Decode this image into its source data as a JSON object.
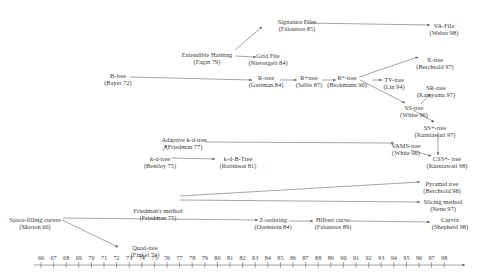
{
  "diagram": {
    "nodes": [
      {
        "id": "sigfiles",
        "label": "Signature Files",
        "ref": "(Faloutsos 85)",
        "x": 297,
        "y": 18
      },
      {
        "id": "vafile",
        "label": "VA-File",
        "ref": "(Weber 98)",
        "x": 444,
        "y": 22
      },
      {
        "id": "exthash",
        "label": "Extendible Hashing",
        "ref": "(Fagin 79)",
        "x": 207,
        "y": 51
      },
      {
        "id": "gridfile",
        "label": "Grid File",
        "ref": "(Nievergelt 84)",
        "x": 268,
        "y": 52
      },
      {
        "id": "btree",
        "label": "B-tree",
        "ref": "(Bayer 72)",
        "x": 118,
        "y": 72
      },
      {
        "id": "rtree",
        "label": "R-tree",
        "ref": "(Guttman 84)",
        "x": 266,
        "y": 74
      },
      {
        "id": "rplustree",
        "label": "R+tree",
        "ref": "(Sellis 87)",
        "x": 309,
        "y": 74
      },
      {
        "id": "rstartree",
        "label": "R*-tree",
        "ref": "(Beckmann 90)",
        "x": 347,
        "y": 74
      },
      {
        "id": "xtree",
        "label": "X-tree",
        "ref": "(Berchtold 97)",
        "x": 435,
        "y": 56
      },
      {
        "id": "tvtree",
        "label": "TV-tree",
        "ref": "(Lin 94)",
        "x": 394,
        "y": 76
      },
      {
        "id": "srtree",
        "label": "SR-tree",
        "ref": "(Katayama 97)",
        "x": 436,
        "y": 84
      },
      {
        "id": "sstree",
        "label": "SS-tree",
        "ref": "(White 96)",
        "x": 414,
        "y": 104
      },
      {
        "id": "ssplustree",
        "label": "SS+-tree",
        "ref": "(Kurniawati 97)",
        "x": 435,
        "y": 124
      },
      {
        "id": "adaptkd",
        "label": "Adaptive k-d-tree",
        "ref": "(Friedman 77)",
        "x": 184,
        "y": 136
      },
      {
        "id": "vamstree",
        "label": "VAMS-tree",
        "ref": "(White 96)",
        "x": 406,
        "y": 142
      },
      {
        "id": "csstree",
        "label": "CSS+- tree",
        "ref": "(Kurniawati 98)",
        "x": 447,
        "y": 155
      },
      {
        "id": "kdtree",
        "label": "k-d-tree",
        "ref": "(Bentley 75)",
        "x": 160,
        "y": 155
      },
      {
        "id": "kdbtree",
        "label": "k-d-B-Tree",
        "ref": "(Robinson 81)",
        "x": 238,
        "y": 155
      },
      {
        "id": "friedman",
        "label": "Friedman's method",
        "ref": "(Friedman 75)",
        "x": 158,
        "y": 207
      },
      {
        "id": "pyramid",
        "label": "Pyramid tree",
        "ref": "(Berchtold 98)",
        "x": 442,
        "y": 180
      },
      {
        "id": "slicing",
        "label": "Slicing method",
        "ref": "(Nene 97)",
        "x": 443,
        "y": 198
      },
      {
        "id": "sfc",
        "label": "Space-filling curves",
        "ref": "(Morton 66)",
        "x": 35,
        "y": 216
      },
      {
        "id": "zorder",
        "label": "Z-ordering",
        "ref": "(Orenstein 84)",
        "x": 273,
        "y": 216
      },
      {
        "id": "hilbert",
        "label": "Hilbert curve",
        "ref": "(Faloutsos 89)",
        "x": 333,
        "y": 216
      },
      {
        "id": "curvix",
        "label": "Curvix",
        "ref": "(Shepherd 98)",
        "x": 450,
        "y": 216
      },
      {
        "id": "quadtree",
        "label": "Quad-tree",
        "ref": "(Finkel 74)",
        "x": 145,
        "y": 244
      }
    ],
    "axis": {
      "years": [
        "66",
        "67",
        "68",
        "69",
        "70",
        "71",
        "72",
        "73",
        "74",
        "75",
        "76",
        "77",
        "78",
        "79",
        "80",
        "81",
        "82",
        "83",
        "84",
        "85",
        "86",
        "87",
        "88",
        "89",
        "90",
        "91",
        "92",
        "93",
        "94",
        "95",
        "96",
        "97",
        "98"
      ]
    }
  }
}
